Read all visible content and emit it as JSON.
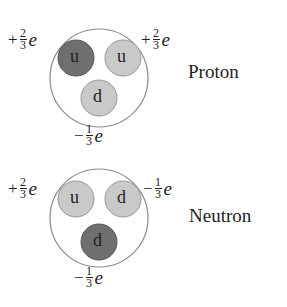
{
  "colors": {
    "outer": "#888888",
    "dark_quark": "#6f6f6f",
    "light_quark": "#c8c8c8",
    "quark_border": "#999999"
  },
  "proton": {
    "label": "Proton",
    "quarks": [
      {
        "flavor": "u",
        "shade": "dark",
        "charge": {
          "sign": "+",
          "num": "2",
          "den": "3",
          "unit": "e"
        }
      },
      {
        "flavor": "u",
        "shade": "light",
        "charge": {
          "sign": "+",
          "num": "2",
          "den": "3",
          "unit": "e"
        }
      },
      {
        "flavor": "d",
        "shade": "light",
        "charge": {
          "sign": "−",
          "num": "1",
          "den": "3",
          "unit": "e"
        }
      }
    ]
  },
  "neutron": {
    "label": "Neutron",
    "quarks": [
      {
        "flavor": "u",
        "shade": "light",
        "charge": {
          "sign": "+",
          "num": "2",
          "den": "3",
          "unit": "e"
        }
      },
      {
        "flavor": "d",
        "shade": "light",
        "charge": {
          "sign": "−",
          "num": "1",
          "den": "3",
          "unit": "e"
        }
      },
      {
        "flavor": "d",
        "shade": "dark",
        "charge": {
          "sign": "−",
          "num": "1",
          "den": "3",
          "unit": "e"
        }
      }
    ]
  }
}
